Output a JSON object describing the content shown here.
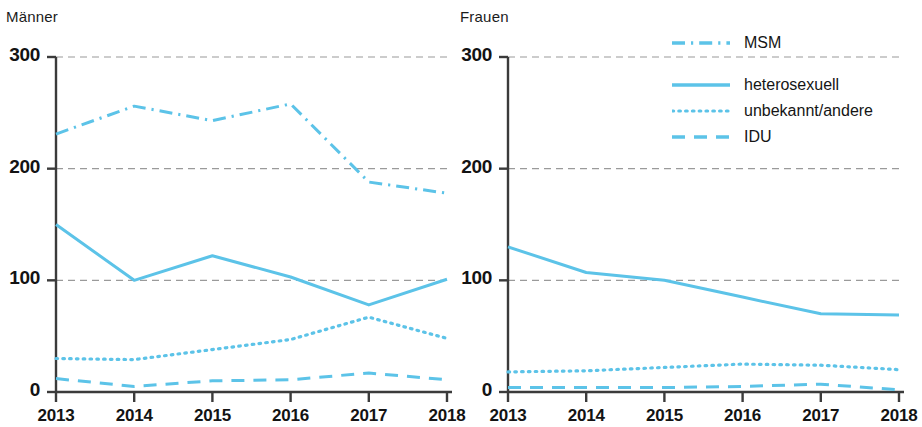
{
  "legend": {
    "position": "top-right",
    "entries": [
      {
        "label": "MSM",
        "style": "dashdot"
      },
      {
        "label": "heterosexuell",
        "style": "solid"
      },
      {
        "label": "unbekannt/andere",
        "style": "dotted"
      },
      {
        "label": "IDU",
        "style": "dashed"
      }
    ]
  },
  "colors": {
    "line": "#5cc3e8",
    "axis": "#3b3b3b",
    "grid": "#9a9a9a",
    "text": "#131313"
  },
  "chart_data": [
    {
      "type": "line",
      "title": "Männer",
      "xlabel": "",
      "ylabel": "",
      "x": [
        "2013",
        "2014",
        "2015",
        "2016",
        "2017",
        "2018"
      ],
      "categories": [
        "2013",
        "2014",
        "2015",
        "2016",
        "2017",
        "2018"
      ],
      "ylim": [
        0,
        300
      ],
      "yticks": [
        0,
        100,
        200,
        300
      ],
      "grid": true,
      "series": [
        {
          "name": "MSM",
          "style": "dashdot",
          "values": [
            231,
            256,
            243,
            258,
            188,
            178
          ]
        },
        {
          "name": "heterosexuell",
          "style": "solid",
          "values": [
            150,
            100,
            122,
            103,
            78,
            101
          ]
        },
        {
          "name": "unbekannt/andere",
          "style": "dotted",
          "values": [
            30,
            29,
            38,
            47,
            67,
            48
          ]
        },
        {
          "name": "IDU",
          "style": "dashed",
          "values": [
            12,
            5,
            10,
            11,
            17,
            11
          ]
        }
      ]
    },
    {
      "type": "line",
      "title": "Frauen",
      "xlabel": "",
      "ylabel": "",
      "x": [
        "2013",
        "2014",
        "2015",
        "2016",
        "2017",
        "2018"
      ],
      "categories": [
        "2013",
        "2014",
        "2015",
        "2016",
        "2017",
        "2018"
      ],
      "ylim": [
        0,
        300
      ],
      "yticks": [
        0,
        100,
        200,
        300
      ],
      "grid": true,
      "series": [
        {
          "name": "MSM",
          "style": "dashdot",
          "values": [
            null,
            null,
            null,
            null,
            null,
            null
          ]
        },
        {
          "name": "heterosexuell",
          "style": "solid",
          "values": [
            130,
            107,
            100,
            85,
            70,
            69
          ]
        },
        {
          "name": "unbekannt/andere",
          "style": "dotted",
          "values": [
            18,
            19,
            22,
            25,
            24,
            20
          ]
        },
        {
          "name": "IDU",
          "style": "dashed",
          "values": [
            4,
            4,
            4,
            5,
            7,
            2
          ]
        }
      ]
    }
  ]
}
